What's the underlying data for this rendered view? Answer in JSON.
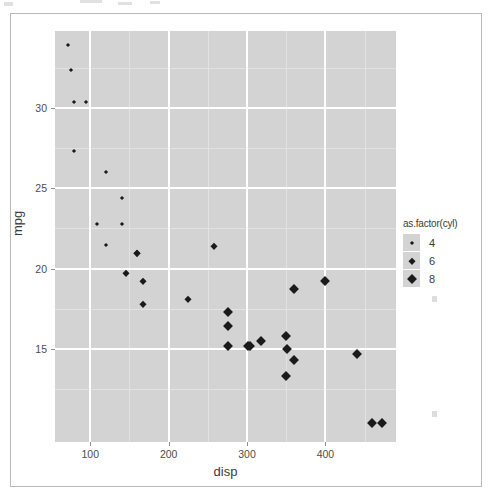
{
  "chart_data": {
    "type": "scatter",
    "title": "",
    "xlabel": "disp",
    "ylabel": "mpg",
    "xlim": [
      55,
      490
    ],
    "ylim": [
      9.2,
      34.8
    ],
    "xticks": [
      100,
      200,
      300,
      400
    ],
    "yticks": [
      15,
      20,
      25,
      30
    ],
    "xtick_labels": [
      "100",
      "200",
      "300",
      "400"
    ],
    "ytick_labels": [
      "15",
      "20",
      "25",
      "30"
    ],
    "grid": "major white, minor light grey",
    "legend": {
      "title": "as.factor(cyl)",
      "position": "right",
      "entries": [
        {
          "label": "4",
          "size": "small"
        },
        {
          "label": "6",
          "size": "medium"
        },
        {
          "label": "8",
          "size": "large"
        }
      ]
    },
    "series": [
      {
        "name": "4",
        "cyl": 4,
        "points": [
          {
            "disp": 71.1,
            "mpg": 33.9
          },
          {
            "disp": 75.7,
            "mpg": 32.4
          },
          {
            "disp": 78.7,
            "mpg": 30.4
          },
          {
            "disp": 95.1,
            "mpg": 30.4
          },
          {
            "disp": 79.0,
            "mpg": 27.3
          },
          {
            "disp": 120.1,
            "mpg": 26.0
          },
          {
            "disp": 140.8,
            "mpg": 24.4
          },
          {
            "disp": 108.0,
            "mpg": 22.8
          },
          {
            "disp": 140.8,
            "mpg": 22.8
          },
          {
            "disp": 120.3,
            "mpg": 21.5
          }
        ]
      },
      {
        "name": "6",
        "cyl": 6,
        "points": [
          {
            "disp": 160.0,
            "mpg": 21.0
          },
          {
            "disp": 160.0,
            "mpg": 21.0
          },
          {
            "disp": 258.0,
            "mpg": 21.4
          },
          {
            "disp": 167.6,
            "mpg": 19.2
          },
          {
            "disp": 167.6,
            "mpg": 17.8
          },
          {
            "disp": 145.0,
            "mpg": 19.7
          },
          {
            "disp": 225.0,
            "mpg": 18.1
          }
        ]
      },
      {
        "name": "8",
        "cyl": 8,
        "points": [
          {
            "disp": 275.8,
            "mpg": 17.3
          },
          {
            "disp": 275.8,
            "mpg": 16.4
          },
          {
            "disp": 275.8,
            "mpg": 15.2
          },
          {
            "disp": 301.0,
            "mpg": 15.2
          },
          {
            "disp": 304.0,
            "mpg": 15.2
          },
          {
            "disp": 318.0,
            "mpg": 15.5
          },
          {
            "disp": 350.0,
            "mpg": 15.8
          },
          {
            "disp": 351.0,
            "mpg": 15.0
          },
          {
            "disp": 360.0,
            "mpg": 14.3
          },
          {
            "disp": 360.0,
            "mpg": 18.7
          },
          {
            "disp": 400.0,
            "mpg": 19.2
          },
          {
            "disp": 440.0,
            "mpg": 14.7
          },
          {
            "disp": 350.0,
            "mpg": 13.3
          },
          {
            "disp": 460.0,
            "mpg": 10.4
          },
          {
            "disp": 472.0,
            "mpg": 10.4
          }
        ]
      }
    ],
    "minor_xticks": [
      150,
      250,
      350,
      450
    ],
    "minor_yticks": [
      12.5,
      17.5,
      22.5,
      27.5,
      32.5
    ],
    "colors": {
      "panel_background": "#d3d3d3",
      "grid_major": "#ffffff",
      "grid_minor": "#e2e2e2",
      "point": "#1a1a1a",
      "text": "#3b3b3b",
      "frame_border": "#b9b9b9"
    }
  }
}
